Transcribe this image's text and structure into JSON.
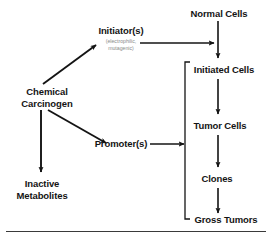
{
  "figure": {
    "title_text": "",
    "line_color": "#141414",
    "text_color": "#141414",
    "note_color": "#8a8a8a",
    "background": "#ffffff"
  },
  "nodes": {
    "chemical_carcinogen": {
      "line1": "Chemical",
      "line2": "Carcinogen"
    },
    "initiator": {
      "label": "Initiator(s)",
      "note_line1": "(electrophilic,",
      "note_line2": "mutagenic)"
    },
    "promoter": {
      "label": "Promoter(s)"
    },
    "inactive_metabolites": {
      "line1": "Inactive",
      "line2": "Metabolites"
    },
    "normal_cells": {
      "label": "Normal Cells"
    },
    "initiated_cells": {
      "label": "Initiated Cells"
    },
    "tumor_cells": {
      "label": "Tumor Cells"
    },
    "clones": {
      "label": "Clones"
    },
    "gross_tumors": {
      "label": "Gross Tumors"
    }
  },
  "edges": [
    {
      "name": "carcinogen-to-initiator",
      "type": "arrow-diagonal-up"
    },
    {
      "name": "carcinogen-to-promoter",
      "type": "arrow-diagonal-down"
    },
    {
      "name": "carcinogen-to-inactive-metabolites",
      "type": "arrow-down"
    },
    {
      "name": "initiator-to-normal-cells-pathway",
      "type": "arrow-right"
    },
    {
      "name": "promoter-to-bracket",
      "type": "arrow-right"
    },
    {
      "name": "normal-cells-to-initiated-cells",
      "type": "arrow-down"
    },
    {
      "name": "initiated-cells-to-tumor-cells",
      "type": "arrow-down"
    },
    {
      "name": "tumor-cells-to-clones",
      "type": "arrow-down"
    },
    {
      "name": "clones-to-gross-tumors",
      "type": "arrow-down"
    }
  ],
  "bracket": {
    "name": "progression-bracket",
    "orientation": "left-facing"
  },
  "footer": {
    "rule": true
  }
}
